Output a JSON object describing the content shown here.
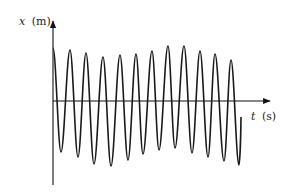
{
  "chart_data": {
    "type": "line",
    "title": "",
    "xlabel": "t (s)",
    "ylabel": "x (m)",
    "xlabel_var": "t",
    "xlabel_unit": "(s)",
    "ylabel_var": "x",
    "ylabel_unit": "(m)",
    "grid": false,
    "legend": null,
    "ticks": "none",
    "series": [
      {
        "name": "x(t)",
        "color": "#1a1a1a",
        "points_px": [
          [
            53,
            48
          ],
          [
            61,
            152
          ],
          [
            70,
            50
          ],
          [
            78,
            157
          ],
          [
            86,
            53
          ],
          [
            94,
            164
          ],
          [
            103,
            57
          ],
          [
            111,
            166
          ],
          [
            120,
            55
          ],
          [
            128,
            160
          ],
          [
            136,
            54
          ],
          [
            143,
            154
          ],
          [
            152,
            51
          ],
          [
            159,
            150
          ],
          [
            168,
            46
          ],
          [
            175,
            148
          ],
          [
            184,
            46
          ],
          [
            192,
            153
          ],
          [
            200,
            51
          ],
          [
            208,
            157
          ],
          [
            215,
            54
          ],
          [
            224,
            161
          ],
          [
            231,
            60
          ],
          [
            239,
            165
          ],
          [
            241,
            117
          ]
        ],
        "peaks_relative": [
          1.0,
          0.97,
          0.92,
          0.86,
          0.89,
          0.9,
          0.95,
          1.02,
          1.02,
          0.95,
          0.9,
          0.8
        ],
        "troughs_relative": [
          -0.97,
          -1.06,
          -1.18,
          -1.22,
          -1.11,
          -1.0,
          -0.93,
          -0.89,
          -0.98,
          -1.06,
          -1.13,
          -1.2
        ]
      }
    ],
    "axes": {
      "origin_px": [
        53,
        101
      ],
      "x_axis_end_px": 270,
      "y_axis_top_px": 20,
      "y_axis_bottom_px": 185
    }
  }
}
